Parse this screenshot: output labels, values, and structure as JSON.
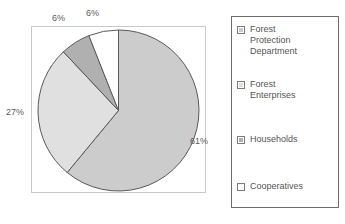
{
  "chart_data": {
    "type": "pie",
    "title": "",
    "categories": [
      "Forest Protection Department",
      "Forest Enterprises",
      "Households",
      "Cooperatives"
    ],
    "values": [
      61,
      27,
      6,
      6
    ],
    "value_labels": [
      "61%",
      "27%",
      "6%",
      "6%"
    ],
    "units": "percent",
    "start_angle_deg": 0,
    "direction": "clockwise",
    "legend_position": "right",
    "grid": false,
    "slice_colors": [
      "#cccccc",
      "#e0e0e0",
      "#b0b0b0",
      "#ffffff"
    ],
    "slice_outline_color": "#595959",
    "plot_border_color": "#c9c9c9",
    "legend_border_color": "#6d6d6d"
  },
  "labels": {
    "protection": "61%",
    "enterprises": "27%",
    "households": "6%",
    "cooperatives": "6%"
  },
  "legend": {
    "items": [
      {
        "label": "Forest\nProtection\nDepartment",
        "swatch_name": "legend-swatch-forest-protection-department"
      },
      {
        "label": "Forest\nEnterprises",
        "swatch_name": "legend-swatch-forest-enterprises"
      },
      {
        "label": "Households",
        "swatch_name": "legend-swatch-households"
      },
      {
        "label": "Cooperatives",
        "swatch_name": "legend-swatch-cooperatives"
      }
    ]
  }
}
